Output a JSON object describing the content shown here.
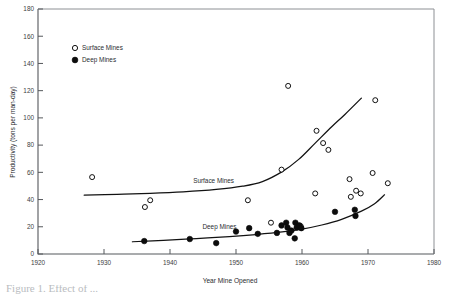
{
  "figure": {
    "caption_partial": "Figure 1. Effect of ..."
  },
  "chart_data": {
    "type": "scatter",
    "title": "",
    "xlabel": "Year Mine Opened",
    "ylabel": "Productivity (tons per man-day)",
    "xlim": [
      1920,
      1980
    ],
    "ylim": [
      0,
      180
    ],
    "xticks": [
      1920,
      1930,
      1940,
      1950,
      1960,
      1970,
      1980
    ],
    "yticks": [
      0,
      20,
      40,
      60,
      80,
      100,
      120,
      140,
      160,
      180
    ],
    "grid": false,
    "legend_position": "upper-left",
    "legend": [
      {
        "label": "Surface Mines",
        "marker": "open-circle"
      },
      {
        "label": "Deep Mines",
        "marker": "filled-circle"
      }
    ],
    "annotations": [
      {
        "text": "Surface Mines",
        "x": 1946.6,
        "y": 52.0
      },
      {
        "text": "Deep Mines",
        "x": 1947.5,
        "y": 18.5
      }
    ],
    "series": [
      {
        "name": "Surface Mines",
        "marker": "open-circle",
        "points": [
          [
            1928.2,
            56.5
          ],
          [
            1936.2,
            34.5
          ],
          [
            1937.0,
            39.5
          ],
          [
            1951.8,
            39.5
          ],
          [
            1955.3,
            23.0
          ],
          [
            1956.9,
            62.0
          ],
          [
            1957.9,
            123.5
          ],
          [
            1959.8,
            20.5
          ],
          [
            1962.0,
            44.5
          ],
          [
            1962.2,
            90.5
          ],
          [
            1963.2,
            81.5
          ],
          [
            1964.0,
            76.5
          ],
          [
            1967.2,
            55.0
          ],
          [
            1967.4,
            42.0
          ],
          [
            1968.2,
            46.5
          ],
          [
            1968.9,
            44.5
          ],
          [
            1970.7,
            59.5
          ],
          [
            1971.1,
            113.0
          ],
          [
            1973.0,
            52.0
          ]
        ]
      },
      {
        "name": "Deep Mines",
        "marker": "filled-circle",
        "points": [
          [
            1936.1,
            9.5
          ],
          [
            1943.0,
            11.0
          ],
          [
            1947.0,
            8.0
          ],
          [
            1950.0,
            16.5
          ],
          [
            1952.0,
            19.0
          ],
          [
            1953.3,
            14.8
          ],
          [
            1956.2,
            15.5
          ],
          [
            1956.9,
            21.0
          ],
          [
            1957.6,
            23.0
          ],
          [
            1957.8,
            19.5
          ],
          [
            1958.1,
            15.5
          ],
          [
            1958.4,
            17.2
          ],
          [
            1958.9,
            11.5
          ],
          [
            1959.0,
            23.0
          ],
          [
            1959.2,
            19.5
          ],
          [
            1959.6,
            21.0
          ],
          [
            1959.9,
            19.0
          ],
          [
            1965.0,
            31.0
          ],
          [
            1968.0,
            32.5
          ],
          [
            1968.1,
            28.0
          ]
        ]
      }
    ],
    "trend_curves": [
      {
        "name": "Surface Mines trend",
        "x_range": [
          1927.0,
          1969.0
        ],
        "points": [
          [
            1927.0,
            43.2
          ],
          [
            1932.0,
            43.8
          ],
          [
            1937.0,
            44.5
          ],
          [
            1942.0,
            45.6
          ],
          [
            1947.0,
            47.4
          ],
          [
            1951.0,
            49.8
          ],
          [
            1954.0,
            53.2
          ],
          [
            1957.0,
            60.5
          ],
          [
            1959.5,
            69.5
          ],
          [
            1962.0,
            81.5
          ],
          [
            1964.5,
            93.5
          ],
          [
            1966.5,
            102.5
          ],
          [
            1969.0,
            114.5
          ]
        ]
      },
      {
        "name": "Deep Mines trend",
        "x_range": [
          1934.3,
          1972.5
        ],
        "points": [
          [
            1934.3,
            9.0
          ],
          [
            1939.0,
            10.0
          ],
          [
            1944.0,
            11.3
          ],
          [
            1949.0,
            12.8
          ],
          [
            1953.0,
            14.3
          ],
          [
            1957.0,
            16.2
          ],
          [
            1960.0,
            18.3
          ],
          [
            1963.0,
            21.3
          ],
          [
            1966.0,
            25.5
          ],
          [
            1969.0,
            31.5
          ],
          [
            1971.0,
            37.0
          ],
          [
            1972.5,
            43.5
          ]
        ]
      }
    ]
  }
}
